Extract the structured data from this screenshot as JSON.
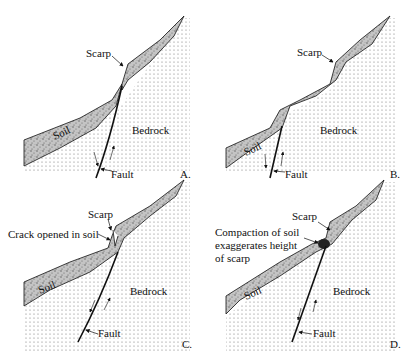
{
  "figure": {
    "colors": {
      "background": "#ffffff",
      "ink": "#111111",
      "soil_fill": "#b8b8b8",
      "bedrock_dot": "#777777"
    },
    "panels": [
      {
        "id": "A",
        "letter": "A.",
        "labels": {
          "scarp": "Scarp",
          "soil": "Soil",
          "bedrock": "Bedrock",
          "fault": "Fault"
        }
      },
      {
        "id": "B",
        "letter": "B.",
        "labels": {
          "scarp": "Scarp",
          "soil": "Soil",
          "bedrock": "Bedrock",
          "fault": "Fault"
        }
      },
      {
        "id": "C",
        "letter": "C.",
        "labels": {
          "scarp": "Scarp",
          "crack": "Crack opened in soil",
          "soil": "Soil",
          "bedrock": "Bedrock",
          "fault": "Fault"
        }
      },
      {
        "id": "D",
        "letter": "D.",
        "labels": {
          "scarp": "Scarp",
          "compaction_line1": "Compaction of soil",
          "compaction_line2": "exaggerates height",
          "compaction_line3": "of scarp",
          "soil": "Soil",
          "bedrock": "Bedrock",
          "fault": "Fault"
        }
      }
    ]
  }
}
